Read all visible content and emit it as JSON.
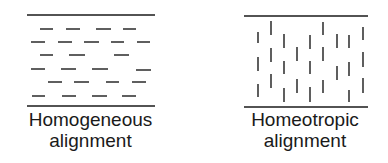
{
  "colors": {
    "ink": "#1a1a1a",
    "background": "#ffffff"
  },
  "panels": [
    {
      "id": "homogeneous",
      "caption_line1": "Homogeneous",
      "caption_line2": "alignment",
      "plates": {
        "x1": 27,
        "x2": 155,
        "top_y": 15,
        "bottom_y": 106
      },
      "molecule_orientation": "horizontal",
      "molecules": [
        [
          40,
          29,
          53,
          29
        ],
        [
          66,
          29,
          80,
          29
        ],
        [
          96,
          29,
          111,
          29
        ],
        [
          123,
          29,
          136,
          29
        ],
        [
          31,
          42,
          45,
          42
        ],
        [
          58,
          42,
          72,
          42
        ],
        [
          84,
          42,
          99,
          42
        ],
        [
          111,
          42,
          124,
          42
        ],
        [
          137,
          42,
          150,
          42
        ],
        [
          40,
          55,
          53,
          55
        ],
        [
          69,
          55,
          85,
          55
        ],
        [
          114,
          55,
          129,
          55
        ],
        [
          31,
          69,
          45,
          69
        ],
        [
          61,
          69,
          76,
          69
        ],
        [
          92,
          69,
          108,
          69
        ],
        [
          136,
          70,
          151,
          70
        ],
        [
          48,
          82,
          62,
          82
        ],
        [
          74,
          82,
          89,
          82
        ],
        [
          106,
          82,
          119,
          82
        ],
        [
          132,
          82,
          146,
          82
        ],
        [
          32,
          96,
          45,
          96
        ],
        [
          62,
          96,
          76,
          96
        ],
        [
          92,
          96,
          107,
          96
        ],
        [
          122,
          96,
          136,
          96
        ]
      ]
    },
    {
      "id": "homeotropic",
      "caption_line1": "Homeotropic",
      "caption_line2": "alignment",
      "plates": {
        "x1": 244,
        "x2": 368,
        "top_y": 16,
        "bottom_y": 107
      },
      "molecule_orientation": "vertical",
      "molecules": [
        [
          258,
          32,
          258,
          43
        ],
        [
          258,
          57,
          258,
          71
        ],
        [
          258,
          84,
          258,
          97
        ],
        [
          271,
          21,
          271,
          35
        ],
        [
          271,
          48,
          271,
          62
        ],
        [
          271,
          74,
          271,
          88
        ],
        [
          284,
          34,
          284,
          48
        ],
        [
          284,
          61,
          284,
          74
        ],
        [
          284,
          88,
          284,
          102
        ],
        [
          297,
          47,
          297,
          61
        ],
        [
          297,
          79,
          297,
          93
        ],
        [
          310,
          35,
          310,
          49
        ],
        [
          310,
          61,
          310,
          74
        ],
        [
          310,
          87,
          310,
          102
        ],
        [
          323,
          22,
          323,
          35
        ],
        [
          323,
          47,
          323,
          61
        ],
        [
          323,
          80,
          323,
          93
        ],
        [
          337,
          34,
          337,
          48
        ],
        [
          337,
          66,
          337,
          80
        ],
        [
          349,
          35,
          349,
          48
        ],
        [
          349,
          62,
          349,
          76
        ],
        [
          349,
          90,
          349,
          102
        ],
        [
          363,
          27,
          363,
          40
        ],
        [
          363,
          52,
          363,
          67
        ],
        [
          363,
          78,
          363,
          93
        ]
      ]
    }
  ]
}
